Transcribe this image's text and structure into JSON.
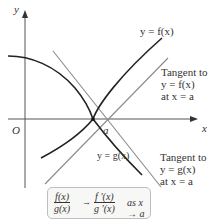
{
  "diagram": {
    "type": "lhopital-tangent-illustration",
    "axes": {
      "x_label": "x",
      "y_label": "y",
      "origin_label": "O"
    },
    "point": {
      "label": "a"
    },
    "curves": [
      {
        "name": "f",
        "label": "y = f(x)",
        "color": "#222222"
      },
      {
        "name": "g",
        "label": "y = g(x)",
        "color": "#222222"
      }
    ],
    "tangents": [
      {
        "for": "f",
        "label_lines": [
          "Tangent to",
          "y = f(x)",
          "at x = a"
        ],
        "color": "#888888"
      },
      {
        "for": "g",
        "label_lines": [
          "Tangent to",
          "y = g(x)",
          "at x = a"
        ],
        "color": "#888888"
      }
    ],
    "formula": {
      "lhs_num": "f(x)",
      "lhs_den": "g(x)",
      "arrow": "→",
      "rhs_num": "f ′(x)",
      "rhs_den": "g ′(x)",
      "condition": "as x → a"
    },
    "colors": {
      "axis": "#555555",
      "curve": "#222222",
      "tangent": "#8a8a8a",
      "box_border": "#bfbfbf",
      "box_fill": "#f7f7f5"
    }
  }
}
